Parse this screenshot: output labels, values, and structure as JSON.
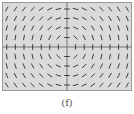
{
  "figure": {
    "label": "(f)",
    "type": "slope-field",
    "equation_pattern": "dy/dx = -x/y",
    "colors": {
      "background": "#dadada",
      "frame": "#9a9a9a",
      "axes": "#777777",
      "segments": "#3e3e3e"
    },
    "grid": {
      "columns": 15,
      "rows": 9,
      "x_range": [
        -7,
        7
      ],
      "y_range": [
        -4,
        4
      ]
    }
  }
}
